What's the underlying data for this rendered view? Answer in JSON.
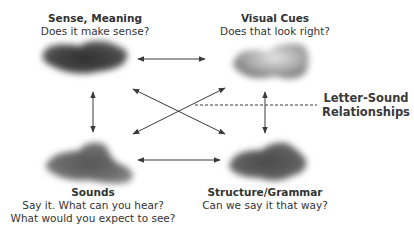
{
  "nodes": {
    "meaning": {
      "title": "Sense, Meaning",
      "lines": [
        "Does it make sense?"
      ]
    },
    "visual": {
      "title": "Visual Cues",
      "lines": [
        "Does that look right?"
      ]
    },
    "sounds": {
      "title": "Sounds",
      "lines": [
        "Say it. What can you hear?",
        "What would you expect to see?"
      ]
    },
    "structure": {
      "title": "Structure/Grammar",
      "lines": [
        "Can we say it that way?"
      ]
    }
  },
  "annotation": {
    "line1": "Letter-Sound",
    "line2": "Relationships"
  },
  "colors": {
    "arrow": "#3a3a3a",
    "cloud_dark": "#3c3c3c",
    "cloud_light": "#9a9a9a"
  }
}
